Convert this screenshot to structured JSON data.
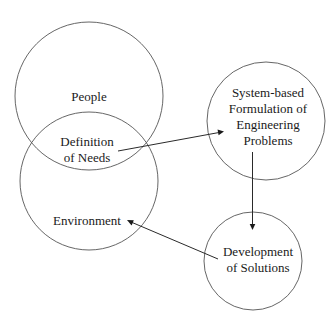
{
  "diagram": {
    "nodes": [
      {
        "id": "people",
        "lines": [
          "People"
        ],
        "cx": 89,
        "cy": 96,
        "r": 74
      },
      {
        "id": "environment",
        "lines": [
          "Environment"
        ],
        "cx": 89,
        "cy": 181,
        "r": 69
      },
      {
        "id": "definition",
        "lines": [
          "Definition",
          "of Needs"
        ],
        "region": "intersection of People and Environment"
      },
      {
        "id": "system",
        "lines": [
          "System-based",
          "Formulation of",
          "Engineering",
          "Problems"
        ],
        "cx": 266,
        "cy": 121,
        "r": 59
      },
      {
        "id": "development",
        "lines": [
          "Development",
          "of Solutions"
        ],
        "cx": 253,
        "cy": 261,
        "r": 49
      }
    ],
    "edges": [
      {
        "from": "definition",
        "to": "system"
      },
      {
        "from": "system",
        "to": "development"
      },
      {
        "from": "development",
        "to": "environment"
      }
    ],
    "colors": {
      "stroke": "#555555",
      "text": "#1a1a1a",
      "background": "#ffffff"
    }
  },
  "labels": {
    "people": "People",
    "definition_1": "Definition",
    "definition_2": "of Needs",
    "environment": "Environment",
    "system_1": "System-based",
    "system_2": "Formulation of",
    "system_3": "Engineering",
    "system_4": "Problems",
    "development_1": "Development",
    "development_2": "of Solutions"
  }
}
